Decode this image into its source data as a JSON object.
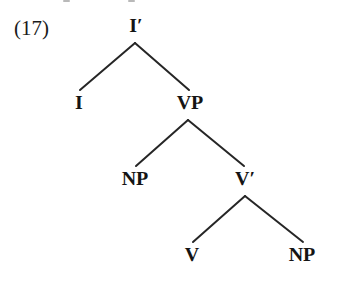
{
  "figure": {
    "example_number": "(17)",
    "background_color": "#ffffff",
    "ink_color": "#141414",
    "width": 338,
    "height": 282
  },
  "tree": {
    "nodes": [
      {
        "id": "ibar",
        "label": "I′",
        "x": 136,
        "y": 16,
        "level": 0
      },
      {
        "id": "i",
        "label": "I",
        "x": 79,
        "y": 93,
        "level": 1
      },
      {
        "id": "vp",
        "label": "VP",
        "x": 190,
        "y": 93,
        "level": 1
      },
      {
        "id": "np1",
        "label": "NP",
        "x": 135,
        "y": 169,
        "level": 2
      },
      {
        "id": "vbar",
        "label": "V′",
        "x": 245,
        "y": 169,
        "level": 2
      },
      {
        "id": "v",
        "label": "V",
        "x": 192,
        "y": 245,
        "level": 3
      },
      {
        "id": "np2",
        "label": "NP",
        "x": 302,
        "y": 245,
        "level": 3
      }
    ],
    "edges": [
      {
        "id": "ibar-i",
        "from": "ibar",
        "to": "i",
        "x1": 135,
        "y1": 43,
        "x2": 80,
        "y2": 90
      },
      {
        "id": "ibar-vp",
        "from": "ibar",
        "to": "vp",
        "x1": 135,
        "y1": 43,
        "x2": 189,
        "y2": 90
      },
      {
        "id": "vp-np1",
        "from": "vp",
        "to": "np1",
        "x1": 188,
        "y1": 120,
        "x2": 136,
        "y2": 166
      },
      {
        "id": "vp-vbar",
        "from": "vp",
        "to": "vbar",
        "x1": 188,
        "y1": 120,
        "x2": 244,
        "y2": 166
      },
      {
        "id": "vbar-v",
        "from": "vbar",
        "to": "v",
        "x1": 245,
        "y1": 196,
        "x2": 193,
        "y2": 242
      },
      {
        "id": "vbar-np2",
        "from": "vbar",
        "to": "np2",
        "x1": 245,
        "y1": 196,
        "x2": 303,
        "y2": 242
      }
    ],
    "line_color": "#262626",
    "line_width": 2
  },
  "label_position": {
    "x": 14,
    "y": 18
  }
}
